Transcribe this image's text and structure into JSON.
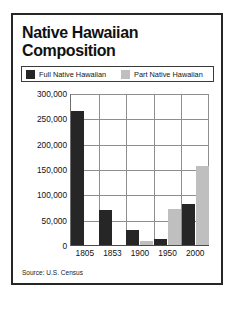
{
  "figure": {
    "title": "Native Hawaiian\nComposition",
    "source": "Source: U.S. Census",
    "border_color": "#262626",
    "background": "#ffffff"
  },
  "chart_data": {
    "type": "bar",
    "title": "Native Hawaiian Composition",
    "xlabel": "",
    "ylabel": "",
    "categories": [
      "1805",
      "1853",
      "1900",
      "1950",
      "2000"
    ],
    "series": [
      {
        "name": "Full Native Hawaiian",
        "color": "#262626",
        "values": [
          265000,
          70000,
          30000,
          12000,
          80000
        ]
      },
      {
        "name": "Part Native Hawaiian",
        "color": "#bfbfbf",
        "values": [
          0,
          0,
          8000,
          72000,
          155000
        ]
      }
    ],
    "ylim": [
      0,
      300000
    ],
    "ytick_values": [
      0,
      50000,
      100000,
      150000,
      200000,
      250000,
      300000
    ],
    "ytick_labels": [
      "0",
      "50,000",
      "100,000",
      "150,000",
      "200,000",
      "250,000",
      "300,000"
    ],
    "grid": true,
    "legend_position": "top",
    "source_note": "Source: U.S. Census"
  }
}
